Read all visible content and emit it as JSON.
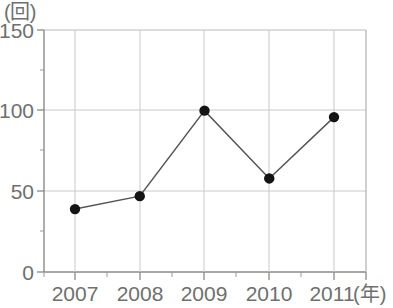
{
  "chart_data": {
    "type": "line",
    "title": "",
    "xlabel": "(年)",
    "ylabel": "(回)",
    "categories": [
      "2007",
      "2008",
      "2009",
      "2010",
      "2011"
    ],
    "x": [
      2007,
      2008,
      2009,
      2010,
      2011
    ],
    "values": [
      39,
      47,
      100,
      58,
      96
    ],
    "series": [
      {
        "name": "",
        "values": [
          39,
          47,
          100,
          58,
          96
        ]
      }
    ],
    "xlim": [
      2006.5,
      2011.5
    ],
    "ylim": [
      0,
      150
    ],
    "ytick_labels": [
      "0",
      "50",
      "100",
      "150"
    ],
    "ytick_values": [
      0,
      50,
      100,
      150
    ],
    "yminor_values": [
      25,
      75,
      125
    ],
    "xtick_labels": [
      "2007",
      "2008",
      "2009",
      "2010",
      "2011"
    ],
    "grid": true,
    "legend": "none",
    "marker": "filled-circle",
    "colors": {
      "line": "#555555",
      "marker": "#141414",
      "grid": "#c9c9c9",
      "axis": "#8a8a8a",
      "text": "#6f6f6f"
    }
  },
  "axes": {
    "y_unit": "(回)",
    "x_unit": "(年)",
    "y_ticks": [
      {
        "label": "150",
        "value": 150
      },
      {
        "label": "100",
        "value": 100
      },
      {
        "label": "50",
        "value": 50
      },
      {
        "label": "0",
        "value": 0
      }
    ],
    "x_ticks": [
      {
        "label": "2007",
        "value": 2007
      },
      {
        "label": "2008",
        "value": 2008
      },
      {
        "label": "2009",
        "value": 2009
      },
      {
        "label": "2010",
        "value": 2010
      },
      {
        "label": "2011",
        "value": 2011
      }
    ]
  },
  "points": [
    {
      "label": "2007",
      "value": "39"
    },
    {
      "label": "2008",
      "value": "47"
    },
    {
      "label": "2009",
      "value": "100"
    },
    {
      "label": "2010",
      "value": "58"
    },
    {
      "label": "2011",
      "value": "96"
    }
  ]
}
